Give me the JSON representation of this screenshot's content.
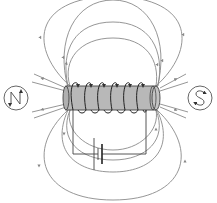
{
  "diagram": {
    "title": "Magnetic field of a solenoid (electromagnet)",
    "labels": {
      "left_compass": "N",
      "right_compass": "S"
    },
    "components": [
      "solenoid-core",
      "coil-windings",
      "battery",
      "circuit-wire",
      "field-lines",
      "compass-north",
      "compass-south"
    ],
    "coil_turns": 6,
    "colors": {
      "core_fill": "#b8b8b8",
      "field_line": "#8a8a8a",
      "wire": "#444444",
      "background": "#ffffff"
    }
  }
}
